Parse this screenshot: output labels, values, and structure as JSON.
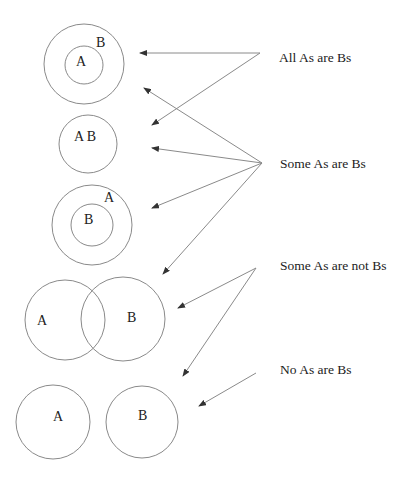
{
  "diagram": {
    "statements": [
      {
        "id": "all",
        "label": "All As are Bs",
        "x": 279,
        "y": 62
      },
      {
        "id": "some",
        "label": "Some As are Bs",
        "x": 280,
        "y": 168
      },
      {
        "id": "some_not",
        "label": "Some As are not Bs",
        "x": 280,
        "y": 270
      },
      {
        "id": "none",
        "label": "No As are Bs",
        "x": 280,
        "y": 374
      }
    ],
    "figures": [
      {
        "id": "fig-b-contains-a",
        "labels": [
          {
            "text": "B",
            "x": 96,
            "y": 47
          },
          {
            "text": "A",
            "x": 76,
            "y": 66
          }
        ]
      },
      {
        "id": "fig-a-equals-b",
        "labels": [
          {
            "text": "A B",
            "x": 74,
            "y": 141
          }
        ]
      },
      {
        "id": "fig-a-contains-b",
        "labels": [
          {
            "text": "A",
            "x": 104,
            "y": 202
          },
          {
            "text": "B",
            "x": 84,
            "y": 224
          }
        ]
      },
      {
        "id": "fig-overlap",
        "labels": [
          {
            "text": "A",
            "x": 37,
            "y": 325
          },
          {
            "text": "B",
            "x": 127,
            "y": 322
          }
        ]
      },
      {
        "id": "fig-disjoint",
        "labels": [
          {
            "text": "A",
            "x": 53,
            "y": 421
          },
          {
            "text": "B",
            "x": 138,
            "y": 420
          }
        ]
      }
    ],
    "colors": {
      "stroke": "#8a8a8a",
      "text": "#222222",
      "background": "#ffffff"
    }
  }
}
